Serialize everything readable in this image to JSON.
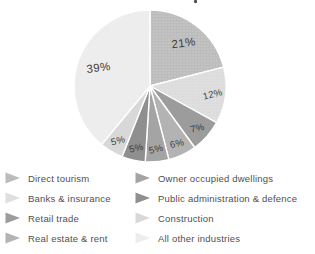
{
  "chart_data": {
    "type": "pie",
    "title": "",
    "unit": "%",
    "start_angle_deg": -90,
    "direction": "clockwise",
    "slices": [
      {
        "label": "Direct tourism",
        "value": 21,
        "display": "21%",
        "color": "#bcbcbc",
        "texture": "dotsA"
      },
      {
        "label": "Banks & insurance",
        "value": 12,
        "display": "12%",
        "color": "#dfdfdf",
        "texture": "dotsB"
      },
      {
        "label": "Retail trade",
        "value": 7,
        "display": "7%",
        "color": "#9c9c9c",
        "texture": "none"
      },
      {
        "label": "Real estate & rent",
        "value": 6,
        "display": "6%",
        "color": "#b3b3b3",
        "texture": "none"
      },
      {
        "label": "Owner occupied dwellings",
        "value": 5,
        "display": "5%",
        "color": "#a4a4a4",
        "texture": "none"
      },
      {
        "label": "Public administration & defence",
        "value": 5,
        "display": "5%",
        "color": "#8f8f8f",
        "texture": "none"
      },
      {
        "label": "Construction",
        "value": 5,
        "display": "5%",
        "color": "#d8d8d8",
        "texture": "none"
      },
      {
        "label": "All other industries",
        "value": 39,
        "display": "39%",
        "color": "#ededed",
        "texture": "none"
      }
    ],
    "legend": {
      "position": "bottom",
      "columns": 2,
      "rows_per_column": 4,
      "marker": "right-arrow"
    },
    "layout": {
      "center_x": 150,
      "center_y": 86,
      "radius": 76,
      "separator_color": "#ffffff",
      "label_color": "#3e3e3e",
      "legend_text_color": "#4f4f4f"
    }
  }
}
